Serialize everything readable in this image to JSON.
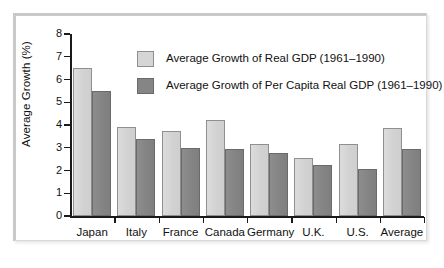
{
  "chart_data": {
    "type": "bar",
    "title": "",
    "xlabel": "",
    "ylabel": "Average Growth (%)",
    "ylim": [
      0,
      8
    ],
    "ytick_labels": [
      "8",
      "7",
      "6",
      "5",
      "4",
      "3",
      "2",
      "1",
      "0"
    ],
    "grid": false,
    "legend_position": "upper-center",
    "categories": [
      "Japan",
      "Italy",
      "France",
      "Canada",
      "Germany",
      "U.K.",
      "U.S.",
      "Average"
    ],
    "series": [
      {
        "name": "Average Growth of Real GDP (1961–1990)",
        "color": "#d5d5d5",
        "values": [
          6.5,
          3.9,
          3.75,
          4.2,
          3.15,
          2.55,
          3.15,
          3.85
        ]
      },
      {
        "name": "Average Growth of Per Capita Real GDP (1961–1990)",
        "color": "#858585",
        "values": [
          5.5,
          3.4,
          3.0,
          2.95,
          2.75,
          2.25,
          2.05,
          2.95
        ]
      }
    ]
  },
  "colors": {
    "series_light": "#d5d5d5",
    "series_dark": "#858585",
    "axis": "#1a1a1a",
    "frame": "#c9c9c9",
    "background": "#ffffff"
  }
}
